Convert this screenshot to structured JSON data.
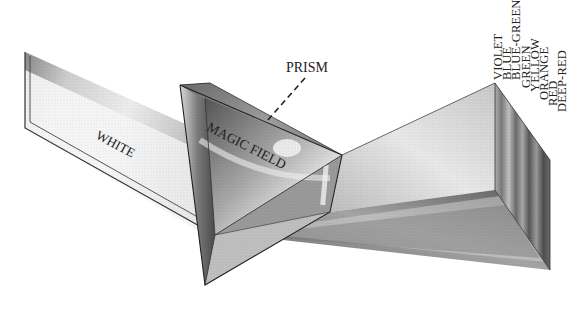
{
  "figure": {
    "labels": {
      "prism": "PRISM",
      "white": "WHITE",
      "magic_field": "MAGIC FIELD"
    },
    "spectrum": [
      {
        "label": "VIOLET"
      },
      {
        "label": "BLUE"
      },
      {
        "label": "BLUE-GREEN"
      },
      {
        "label": "GREEN"
      },
      {
        "label": "YELLOW"
      },
      {
        "label": "ORANGE"
      },
      {
        "label": "RED"
      },
      {
        "label": "DEEP-RED"
      }
    ]
  },
  "colors": {
    "background": "#ffffff",
    "ink": "#222222",
    "shade_dark": "#5a5a5a",
    "shade_mid": "#9a9a9a",
    "shade_light": "#d6d6d6"
  }
}
